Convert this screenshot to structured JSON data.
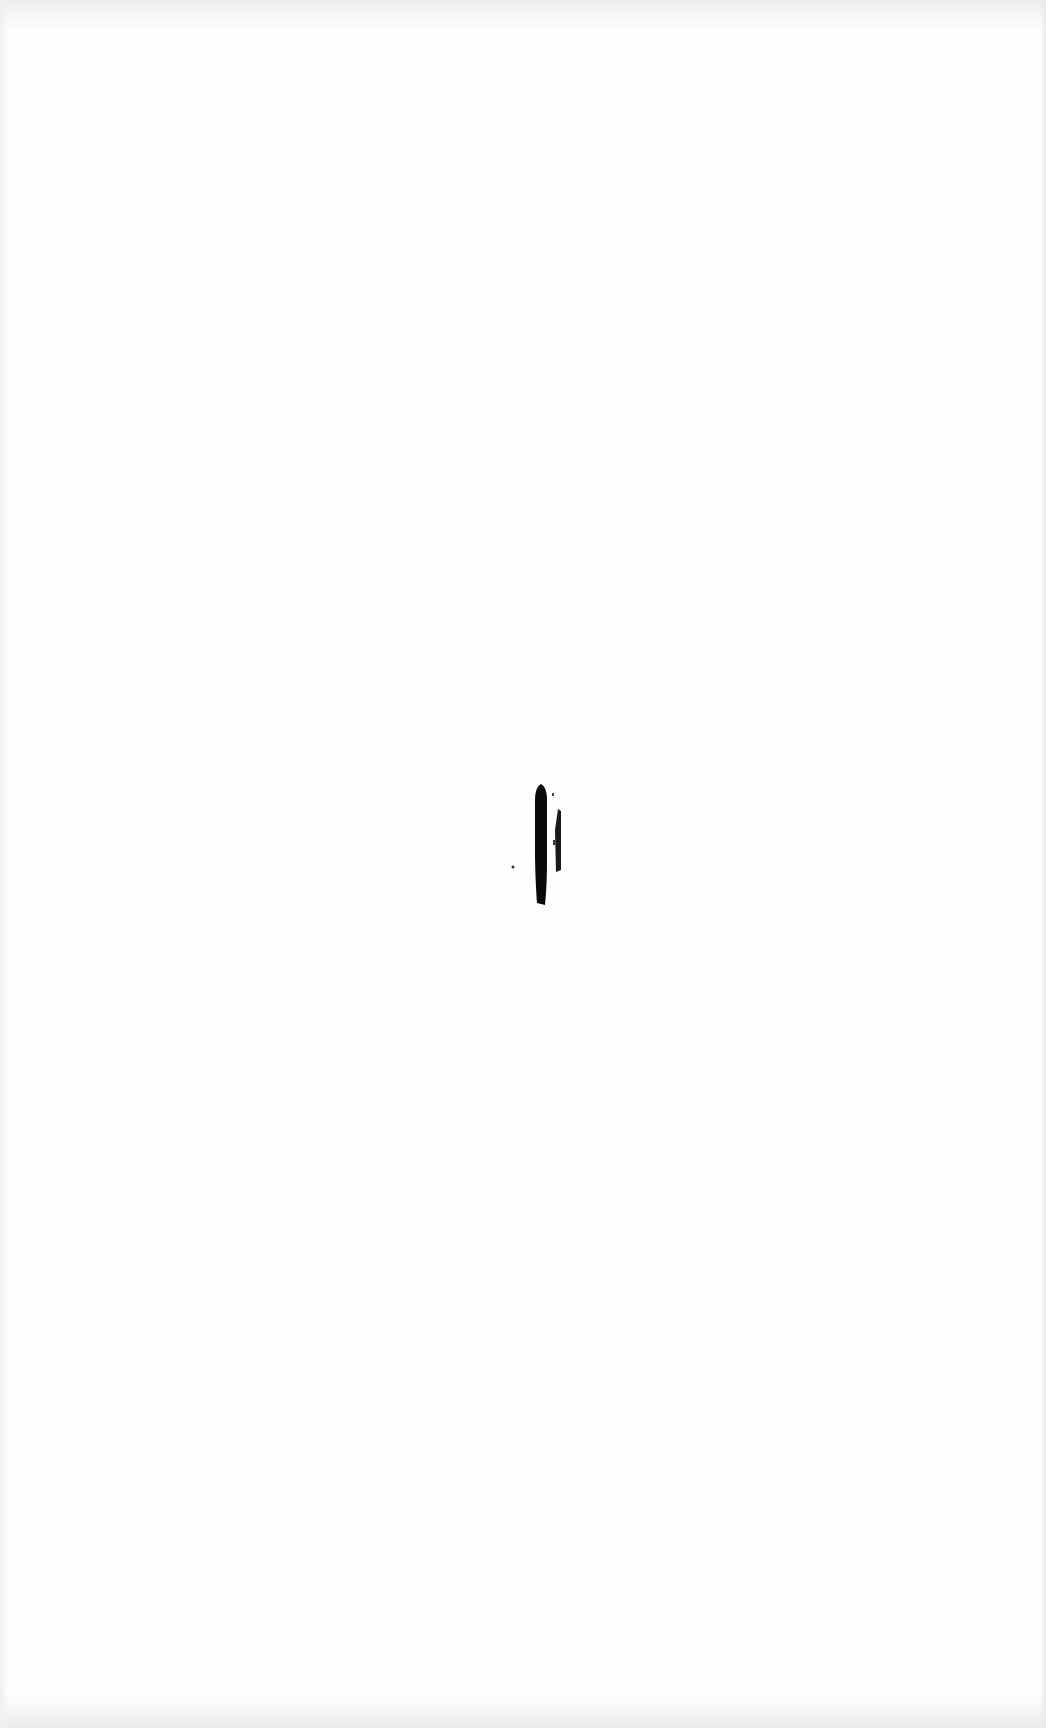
{
  "document": {
    "type": "scanned-page",
    "content": "blank",
    "background_color": "#fefefe",
    "edge_shadow_color": "#ebebeb",
    "marks": [
      {
        "name": "main-vertical-stroke",
        "color": "#0a0a0a",
        "x": 535,
        "y": 785,
        "width": 12,
        "height": 120
      },
      {
        "name": "thin-vertical-stroke",
        "color": "#1a1a1a",
        "x": 555,
        "y": 808,
        "width": 6,
        "height": 64
      },
      {
        "name": "ink-dot",
        "color": "#333333",
        "x": 512,
        "y": 866,
        "width": 3,
        "height": 3
      }
    ]
  }
}
